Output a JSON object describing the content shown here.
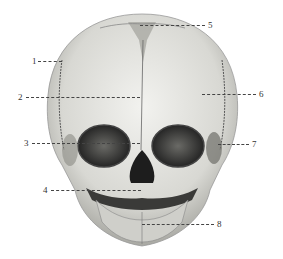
{
  "figure": {
    "labels": [
      {
        "num": "1",
        "x": 32,
        "y": 56
      },
      {
        "num": "2",
        "x": 18,
        "y": 93
      },
      {
        "num": "3",
        "x": 24,
        "y": 139
      },
      {
        "num": "4",
        "x": 43,
        "y": 186
      },
      {
        "num": "5",
        "x": 208,
        "y": 21
      },
      {
        "num": "6",
        "x": 259,
        "y": 90
      },
      {
        "num": "7",
        "x": 252,
        "y": 140
      },
      {
        "num": "8",
        "x": 217,
        "y": 220
      }
    ],
    "colors": {
      "bone_light": "#e6e6e2",
      "bone_mid": "#bdbdb8",
      "bone_dark": "#555552",
      "cavity": "#2a2a2a",
      "leader": "#444444"
    }
  }
}
